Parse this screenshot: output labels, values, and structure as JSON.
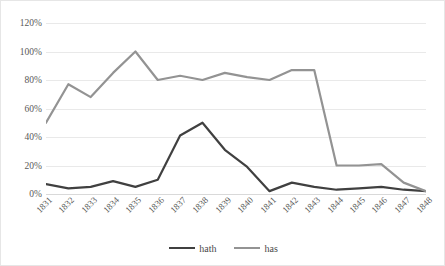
{
  "chart_data": {
    "type": "line",
    "title": "",
    "subtitle": "",
    "xlabel": "",
    "ylabel": "",
    "ylim": [
      0,
      120
    ],
    "yticks": [
      "0%",
      "20%",
      "40%",
      "60%",
      "80%",
      "100%",
      "120%"
    ],
    "ytick_values": [
      0,
      20,
      40,
      60,
      80,
      100,
      120
    ],
    "grid": true,
    "legend_position": "bottom-center",
    "categories": [
      "1831",
      "1832",
      "1833",
      "1834",
      "1835",
      "1836",
      "1837",
      "1838",
      "1839",
      "1840",
      "1841",
      "1842",
      "1843",
      "1844",
      "1845",
      "1846",
      "1847",
      "1848"
    ],
    "series": [
      {
        "name": "hath",
        "color": "#404040",
        "values": [
          7,
          4,
          5,
          9,
          5,
          10,
          41,
          50,
          31,
          19,
          2,
          8,
          5,
          3,
          4,
          5,
          3,
          2
        ]
      },
      {
        "name": "has",
        "color": "#939393",
        "values": [
          50,
          77,
          68,
          85,
          100,
          80,
          83,
          80,
          85,
          82,
          80,
          87,
          87,
          20,
          20,
          21,
          8,
          2
        ]
      }
    ]
  },
  "legend": {
    "entries": [
      {
        "label": "hath",
        "color": "#404040"
      },
      {
        "label": "has",
        "color": "#939393"
      }
    ]
  }
}
